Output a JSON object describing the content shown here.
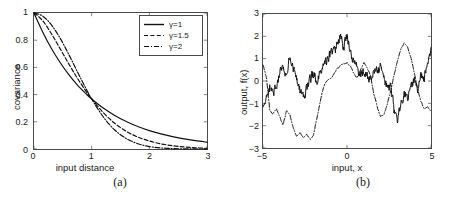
{
  "figure": {
    "panels": [
      {
        "id": "a",
        "caption": "(a)",
        "xlabel": "input distance",
        "ylabel": "covariance",
        "xticks": [
          "0",
          "1",
          "2",
          "3"
        ],
        "yticks": [
          "0",
          "0.2",
          "0.4",
          "0.6",
          "0.8",
          "1"
        ],
        "legend": [
          {
            "label": "γ=1",
            "style": "solid"
          },
          {
            "label": "γ=1.5",
            "style": "dashed"
          },
          {
            "label": "γ=2",
            "style": "dashdot"
          }
        ]
      },
      {
        "id": "b",
        "caption": "(b)",
        "xlabel": "input, x",
        "ylabel": "output, f(x)",
        "xticks": [
          "−5",
          "0",
          "5"
        ],
        "yticks": [
          "−3",
          "−2",
          "−1",
          "0",
          "1",
          "2",
          "3"
        ]
      }
    ]
  },
  "colors": {
    "axis": "#4a4a4a",
    "line": "#111111",
    "background": "#ffffff"
  },
  "chart_data": [
    {
      "type": "line",
      "panel": "a",
      "title": "",
      "xlabel": "input distance",
      "ylabel": "covariance",
      "xlim": [
        0,
        3
      ],
      "ylim": [
        0,
        1
      ],
      "xticks": [
        0,
        1,
        2,
        3
      ],
      "yticks": [
        0,
        0.2,
        0.4,
        0.6,
        0.8,
        1
      ],
      "grid": false,
      "legend_position": "top-right",
      "description": "Gamma-exponential covariance k(r)=exp(-(r)^gamma) for three gamma values; all curves meet at r=1, k=0.368",
      "series": [
        {
          "name": "γ=1",
          "style": "solid",
          "x": [
            0,
            0.15,
            0.3,
            0.45,
            0.6,
            0.75,
            0.9,
            1.0,
            1.2,
            1.4,
            1.6,
            1.8,
            2.0,
            2.2,
            2.4,
            2.6,
            2.8,
            3.0
          ],
          "y": [
            1.0,
            0.861,
            0.741,
            0.638,
            0.549,
            0.472,
            0.407,
            0.368,
            0.301,
            0.247,
            0.202,
            0.165,
            0.135,
            0.111,
            0.091,
            0.074,
            0.061,
            0.05
          ]
        },
        {
          "name": "γ=1.5",
          "style": "dashed",
          "x": [
            0,
            0.15,
            0.3,
            0.45,
            0.6,
            0.75,
            0.9,
            1.0,
            1.2,
            1.4,
            1.6,
            1.8,
            2.0,
            2.2,
            2.4,
            2.6,
            2.8,
            3.0
          ],
          "y": [
            1.0,
            0.944,
            0.849,
            0.74,
            0.628,
            0.522,
            0.426,
            0.368,
            0.268,
            0.189,
            0.13,
            0.088,
            0.059,
            0.038,
            0.024,
            0.015,
            0.009,
            0.005
          ]
        },
        {
          "name": "γ=2",
          "style": "dashdot",
          "x": [
            0,
            0.15,
            0.3,
            0.45,
            0.6,
            0.75,
            0.9,
            1.0,
            1.2,
            1.4,
            1.6,
            1.8,
            2.0,
            2.2,
            2.4,
            2.6,
            2.8,
            3.0
          ],
          "y": [
            1.0,
            0.978,
            0.914,
            0.817,
            0.698,
            0.57,
            0.445,
            0.368,
            0.237,
            0.14,
            0.077,
            0.039,
            0.018,
            0.008,
            0.003,
            0.001,
            0.0003,
            0.0001
          ]
        }
      ]
    },
    {
      "type": "line",
      "panel": "b",
      "title": "",
      "xlabel": "input, x",
      "ylabel": "output, f(x)",
      "xlim": [
        -5,
        5
      ],
      "ylim": [
        -3,
        3
      ],
      "xticks": [
        -5,
        0,
        5
      ],
      "yticks": [
        -3,
        -2,
        -1,
        0,
        1,
        2,
        3
      ],
      "grid": false,
      "description": "Random sample functions drawn from gamma-exponential GP priors: a rough solid path (gamma=1) and a smooth dash-dot path (gamma=2)",
      "series": [
        {
          "name": "sample γ=1 (rough)",
          "style": "solid",
          "x": [
            -5.0,
            -4.8,
            -4.6,
            -4.4,
            -4.2,
            -4.0,
            -3.8,
            -3.6,
            -3.4,
            -3.2,
            -3.0,
            -2.8,
            -2.6,
            -2.4,
            -2.2,
            -2.0,
            -1.8,
            -1.6,
            -1.4,
            -1.2,
            -1.0,
            -0.8,
            -0.6,
            -0.4,
            -0.2,
            0.0,
            0.2,
            0.4,
            0.6,
            0.8,
            1.0,
            1.2,
            1.4,
            1.6,
            1.8,
            2.0,
            2.2,
            2.4,
            2.6,
            2.8,
            3.0,
            3.2,
            3.4,
            3.6,
            3.8,
            4.0,
            4.2,
            4.4,
            4.6,
            4.8,
            5.0
          ],
          "y": [
            -1.15,
            -0.55,
            -0.25,
            -0.6,
            -0.2,
            0.35,
            0.55,
            0.2,
            1.15,
            0.45,
            0.1,
            -0.45,
            -0.7,
            -0.35,
            0.05,
            0.3,
            0.0,
            0.35,
            0.7,
            0.9,
            1.2,
            1.35,
            1.55,
            2.0,
            1.45,
            2.1,
            1.2,
            0.9,
            0.55,
            0.3,
            0.45,
            0.2,
            0.05,
            0.6,
            0.35,
            0.7,
            0.1,
            -0.3,
            -0.15,
            -1.3,
            -1.75,
            -0.95,
            -0.55,
            -0.85,
            -0.35,
            0.0,
            -0.45,
            0.25,
            0.05,
            0.95,
            1.5
          ]
        },
        {
          "name": "sample γ=2 (smooth)",
          "style": "dashdot",
          "x": [
            -5.0,
            -4.8,
            -4.6,
            -4.4,
            -4.2,
            -4.0,
            -3.8,
            -3.6,
            -3.4,
            -3.2,
            -3.0,
            -2.8,
            -2.6,
            -2.4,
            -2.2,
            -2.0,
            -1.8,
            -1.6,
            -1.4,
            -1.2,
            -1.0,
            -0.8,
            -0.6,
            -0.4,
            -0.2,
            0.0,
            0.2,
            0.4,
            0.6,
            0.8,
            1.0,
            1.2,
            1.4,
            1.6,
            1.8,
            2.0,
            2.2,
            2.4,
            2.6,
            2.8,
            3.0,
            3.2,
            3.4,
            3.6,
            3.8,
            4.0,
            4.2,
            4.4,
            4.6,
            4.8,
            5.0
          ],
          "y": [
            0.7,
            0.15,
            -1.3,
            -1.45,
            -1.25,
            -1.6,
            -2.0,
            -1.35,
            -1.55,
            -2.15,
            -2.45,
            -2.3,
            -2.55,
            -2.4,
            -2.6,
            -2.45,
            -1.7,
            -0.95,
            -0.3,
            0.05,
            0.1,
            0.3,
            0.55,
            0.7,
            0.8,
            0.85,
            0.7,
            0.3,
            0.1,
            0.45,
            0.8,
            0.6,
            0.2,
            -0.6,
            -1.2,
            -1.6,
            -1.5,
            -1.05,
            -0.45,
            0.25,
            0.9,
            1.45,
            1.7,
            1.55,
            1.1,
            0.4,
            -0.3,
            -0.95,
            -1.25,
            -1.1,
            -1.3
          ]
        }
      ]
    }
  ]
}
